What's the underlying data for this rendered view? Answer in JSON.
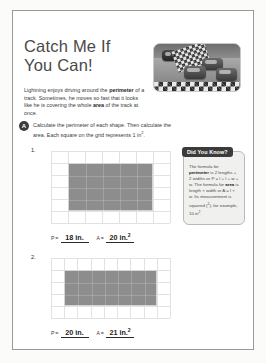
{
  "worksheet": {
    "title_line1": "Catch Me If",
    "title_line2": "You Can!",
    "hero_image_alt": "race-cars-on-track-photo",
    "intro_before": "Lightning enjoys driving around the ",
    "intro_bold1": "perimeter",
    "intro_middle": " of a track. Sometimes, he moves so fast that it looks like he is covering the whole ",
    "intro_bold2": "area",
    "intro_after": " of the track at once."
  },
  "task": {
    "badge": "A",
    "text_part1": "Calculate the perimeter of each shape. Then calculate the area. Each square on the grid represents 1 in",
    "text_sup": "2",
    "text_part2": "."
  },
  "did_you_know": {
    "banner": "Did You Know?",
    "line1": "The formula for ",
    "bold_perimeter": "perimeter",
    "line2": " is 2 lengths + 2 widths or P = l + l + w + w. The formula for ",
    "bold_area": "area",
    "line3": " is length × width or A = l × w. Its measurement is squared (",
    "sup_2": "2",
    "line4": "), for example, 10 in",
    "sup_2b": "2",
    "line5": "."
  },
  "problems": [
    {
      "number": "1.",
      "grid_cols": 7,
      "grid_rows": 6,
      "shape_cols": 5,
      "shape_rows": 4,
      "perimeter_label": "P",
      "perimeter_value": "18 in.",
      "area_label": "A",
      "area_value": "20 in.",
      "area_sup": "2"
    },
    {
      "number": "2.",
      "grid_cols": 9,
      "grid_rows": 5,
      "shape_cols": 7,
      "shape_rows": 3,
      "perimeter_label": "P",
      "perimeter_value": "20 in.",
      "area_label": "A",
      "area_value": "21 in.",
      "area_sup": "2"
    }
  ],
  "colors": {
    "title": "#4a4a4a",
    "shape_fill": "#8d8d8d",
    "grid_line": "#e2e2e2",
    "badge": "#3b3b3b",
    "sidebar_bg": "#f0f0ee"
  }
}
